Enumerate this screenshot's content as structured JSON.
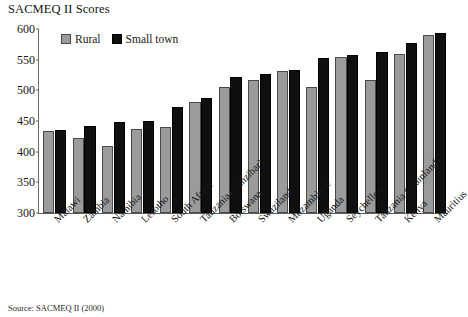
{
  "chart": {
    "title": "SACMEQ II Scores",
    "source_note": "Source: SACMEQ II (2000)"
  },
  "legend": {
    "items": [
      {
        "label": "Rural",
        "color": "#9b9b9b"
      },
      {
        "label": "Small town",
        "color": "#100f10"
      }
    ]
  },
  "chart_data": {
    "type": "bar",
    "title": "SACMEQ II Scores",
    "xlabel": "",
    "ylabel": "",
    "ylim": [
      300,
      600
    ],
    "yticks": [
      300,
      350,
      400,
      450,
      500,
      550,
      600
    ],
    "grid": false,
    "legend_position": "top-left-inside",
    "categories": [
      "Malawi",
      "Zambia",
      "Namibia",
      "Lesotho",
      "South Africa",
      "Tanzania (Zanzibar)",
      "Botswana",
      "Swaziland",
      "Mozambique",
      "Uganda",
      "Seychelles",
      "Tanzania (Mainland)",
      "Kenya",
      "Mauritius"
    ],
    "series": [
      {
        "name": "Rural",
        "color": "#9b9b9b",
        "values": [
          433,
          422,
          409,
          437,
          441,
          481,
          506,
          517,
          531,
          506,
          555,
          517,
          560,
          590
        ]
      },
      {
        "name": "Small town",
        "color": "#100f10",
        "values": [
          435,
          442,
          449,
          450,
          473,
          487,
          522,
          527,
          533,
          552,
          558,
          562,
          578,
          593
        ]
      }
    ],
    "source": "Source: SACMEQ II (2000)"
  }
}
